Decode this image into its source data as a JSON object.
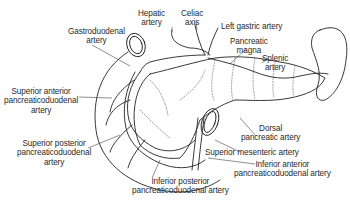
{
  "diagram": {
    "labels": {
      "gastroduodenal": [
        "Gastroduodenal",
        "artery"
      ],
      "hepatic": [
        "Hepatic",
        "artery"
      ],
      "celiac": [
        "Celiac",
        "axis"
      ],
      "left_gastric": [
        "Left gastric artery"
      ],
      "pancreatic_magna": [
        "Pancreatic",
        "magna"
      ],
      "splenic": [
        "Splenic",
        "artery"
      ],
      "superior_anterior": [
        "Superior anterior",
        "pancreaticoduodenal",
        "artery"
      ],
      "superior_posterior": [
        "Superior posterior",
        "pancreaticoduodenal",
        "artery"
      ],
      "dorsal": [
        "Dorsal",
        "pancreatic artery"
      ],
      "superior_mesenteric": [
        "Superior mesenteric artery"
      ],
      "inferior_anterior": [
        "Inferior anterior",
        "pancreaticoduodenal artery"
      ],
      "inferior_posterior": [
        "Inferior posterior",
        "pancreaticoduodenal artery"
      ]
    },
    "colors": {
      "line": "#222222",
      "text": "#2a2a2a",
      "dotted": "#777777",
      "background": "#ffffff"
    }
  }
}
